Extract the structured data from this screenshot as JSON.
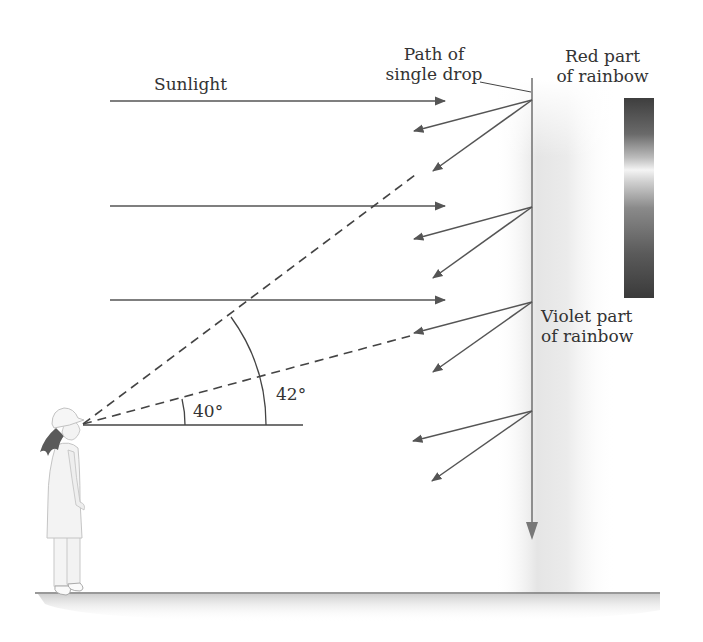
{
  "figure": {
    "labels": {
      "sunlight": "Sunlight",
      "path_line1": "Path of",
      "path_line2": "single drop",
      "red_line1": "Red part",
      "red_line2": "of rainbow",
      "violet_line1": "Violet part",
      "violet_line2": "of rainbow",
      "angle_small": "40°",
      "angle_large": "42°"
    },
    "colors": {
      "line": "#555555",
      "arrow_gray": "#666666",
      "text": "#333333",
      "spectrum_dark": "#3a3a3a",
      "spectrum_light": "#f2f2f2",
      "shadow": "#d8d8d8"
    },
    "geometry": {
      "eye": [
        83,
        424
      ],
      "drop_column_x": 532,
      "drop_points_y": [
        100,
        207,
        302,
        411
      ],
      "sunlight_rays_y": [
        100,
        206,
        300
      ],
      "angles_deg": [
        40,
        42
      ]
    }
  }
}
